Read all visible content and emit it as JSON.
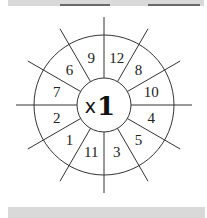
{
  "diagram": {
    "type": "multiplication-wheel",
    "center": {
      "operator": "x",
      "multiplier": "1"
    },
    "sectors": [
      {
        "position": "top-left-inner",
        "label": "9"
      },
      {
        "position": "top-right-inner",
        "label": "12"
      },
      {
        "position": "upper-right",
        "label": "8"
      },
      {
        "position": "right-upper",
        "label": "10"
      },
      {
        "position": "right-lower",
        "label": "4"
      },
      {
        "position": "lower-right",
        "label": "5"
      },
      {
        "position": "bottom-right-inner",
        "label": "3"
      },
      {
        "position": "bottom-left-inner",
        "label": "11"
      },
      {
        "position": "lower-left",
        "label": "1"
      },
      {
        "position": "left-lower",
        "label": "2"
      },
      {
        "position": "left-upper",
        "label": "7"
      },
      {
        "position": "upper-left",
        "label": "6"
      }
    ],
    "colors": {
      "line": "#333333",
      "band": "#d9d9d9",
      "band_mark": "#6b6b6b"
    }
  }
}
